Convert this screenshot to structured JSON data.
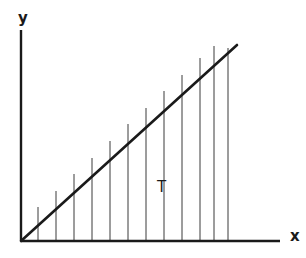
{
  "figure": {
    "kind": "geometry-diagram",
    "background_color": "#ffffff",
    "ink_color": "#1a1a1a",
    "hairline_color": "#3a3a3a",
    "axes": {
      "x_axis": {
        "label": "x",
        "label_x": 290,
        "label_y": 241,
        "start_x": 21,
        "start_y": 241,
        "end_x": 280,
        "end_y": 241,
        "stroke_width": 2.4
      },
      "y_axis": {
        "label": "y",
        "label_x": 18,
        "label_y": 23,
        "start_x": 21,
        "start_y": 241,
        "end_x": 21,
        "end_y": 30,
        "stroke_width": 2.4
      },
      "origin_x": 21,
      "origin_y": 241
    },
    "hypotenuse": {
      "name": "diagonal-line",
      "from_x": 21,
      "from_y": 241,
      "to_x": 237,
      "to_y": 45,
      "stroke_width": 2.6
    },
    "region": {
      "name": "T",
      "label": "T",
      "label_x": 157,
      "label_y": 192
    },
    "strips": {
      "count": 12,
      "stroke_width": 1.0,
      "baseline_y": 241,
      "lines": [
        {
          "x": 38,
          "top_y": 207
        },
        {
          "x": 56,
          "top_y": 191
        },
        {
          "x": 74,
          "top_y": 174
        },
        {
          "x": 92,
          "top_y": 158
        },
        {
          "x": 110,
          "top_y": 141
        },
        {
          "x": 128,
          "top_y": 124
        },
        {
          "x": 146,
          "top_y": 108
        },
        {
          "x": 164,
          "top_y": 91
        },
        {
          "x": 182,
          "top_y": 75
        },
        {
          "x": 200,
          "top_y": 58
        },
        {
          "x": 214,
          "top_y": 46
        },
        {
          "x": 228,
          "top_y": 48
        }
      ]
    }
  }
}
